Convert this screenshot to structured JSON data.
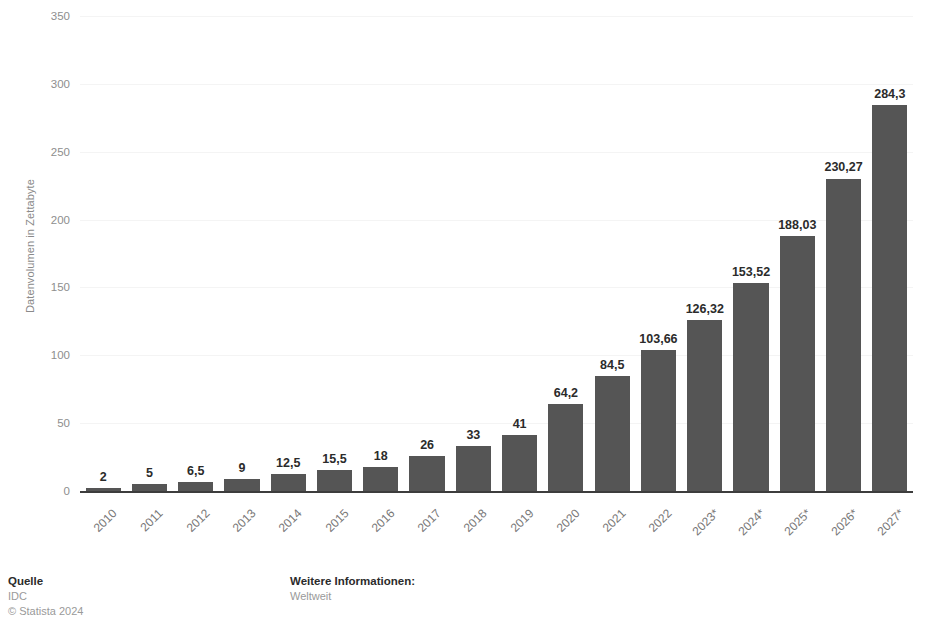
{
  "chart_data": {
    "type": "bar",
    "title": "",
    "subtitle": "",
    "xlabel": "",
    "ylabel": "Datenvolumen in Zettabyte",
    "categories": [
      "2010",
      "2011",
      "2012",
      "2013",
      "2014",
      "2015",
      "2016",
      "2017",
      "2018",
      "2019",
      "2020",
      "2021",
      "2022",
      "2023*",
      "2024*",
      "2025*",
      "2026*",
      "2027*"
    ],
    "values": [
      2,
      5,
      6.5,
      9,
      12.5,
      15.5,
      18,
      26,
      33,
      41,
      64.2,
      84.5,
      103.66,
      126.32,
      153.52,
      188.03,
      230.27,
      284.3
    ],
    "value_labels": [
      "2",
      "5",
      "6,5",
      "9",
      "12,5",
      "15,5",
      "18",
      "26",
      "33",
      "41",
      "64,2",
      "84,5",
      "103,66",
      "126,32",
      "153,52",
      "188,03",
      "230,27",
      "284,3"
    ],
    "ylim": [
      0,
      350
    ],
    "yticks": [
      0,
      50,
      100,
      150,
      200,
      250,
      300,
      350
    ],
    "ytick_labels": [
      "0",
      "50",
      "100",
      "150",
      "200",
      "250",
      "300",
      "350"
    ],
    "grid": true,
    "legend": "none",
    "bar_color": "#555555",
    "axis_color": "#3d3d3d",
    "grid_color": "#f4f4f4",
    "tick_label_color": "#8e8e8e",
    "value_label_color": "#2b2b2b"
  },
  "footer": {
    "source": {
      "title": "Quelle",
      "line1": "IDC",
      "line2": "© Statista 2024"
    },
    "more_info": {
      "title": "Weitere Informationen:",
      "line1": "Weltweit"
    }
  }
}
